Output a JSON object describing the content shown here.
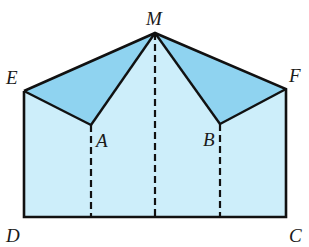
{
  "diagram": {
    "colors": {
      "light_fill": "#cdeefa",
      "dark_fill": "#8fd3f0",
      "stroke": "#111111"
    },
    "points": {
      "E": {
        "label": "E",
        "x": 24,
        "y": 91
      },
      "M": {
        "label": "M",
        "x": 155,
        "y": 33
      },
      "F": {
        "label": "F",
        "x": 286,
        "y": 89
      },
      "A": {
        "label": "A",
        "x": 91,
        "y": 125
      },
      "B": {
        "label": "B",
        "x": 220,
        "y": 124
      },
      "D": {
        "label": "D",
        "x": 24,
        "y": 217
      },
      "C": {
        "label": "C",
        "x": 286,
        "y": 217
      }
    },
    "labels": {
      "M": "M",
      "E": "E",
      "F": "F",
      "A": "A",
      "B": "B",
      "D": "D",
      "C": "C"
    }
  }
}
